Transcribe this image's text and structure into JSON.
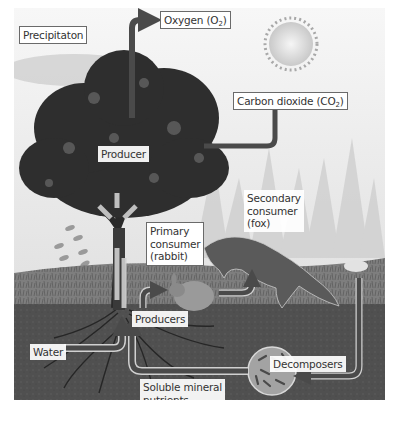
{
  "diagram": {
    "labels": {
      "precipitation": "Precipitaton",
      "oxygen": "Oxygen (O",
      "oxygen_sub": "2",
      "oxygen_end": ")",
      "carbon_dioxide": "Carbon dioxide (CO",
      "carbon_dioxide_sub": "2",
      "carbon_dioxide_end": ")",
      "producer": "Producer",
      "primary_consumer_1": "Primary",
      "primary_consumer_2": "consumer",
      "primary_consumer_3": "(rabbit)",
      "secondary_consumer_1": "Secondary",
      "secondary_consumer_2": "consumer",
      "secondary_consumer_3": "(fox)",
      "producers": "Producers",
      "water": "Water",
      "decomposers": "Decomposers",
      "soluble_1": "Soluble mineral",
      "soluble_2": "nutrients"
    },
    "elements": [
      "sun",
      "tree",
      "rain",
      "rabbit",
      "fox",
      "forest",
      "soil",
      "roots",
      "microbes"
    ],
    "colors": {
      "arrow": "#4a4a4a",
      "arrow_outline": "#d8d8d8",
      "soil": "#4f4f4f",
      "grass": "#7c7c7c",
      "sky": "#f0f0f0",
      "foliage": "#2e2e2e"
    }
  }
}
